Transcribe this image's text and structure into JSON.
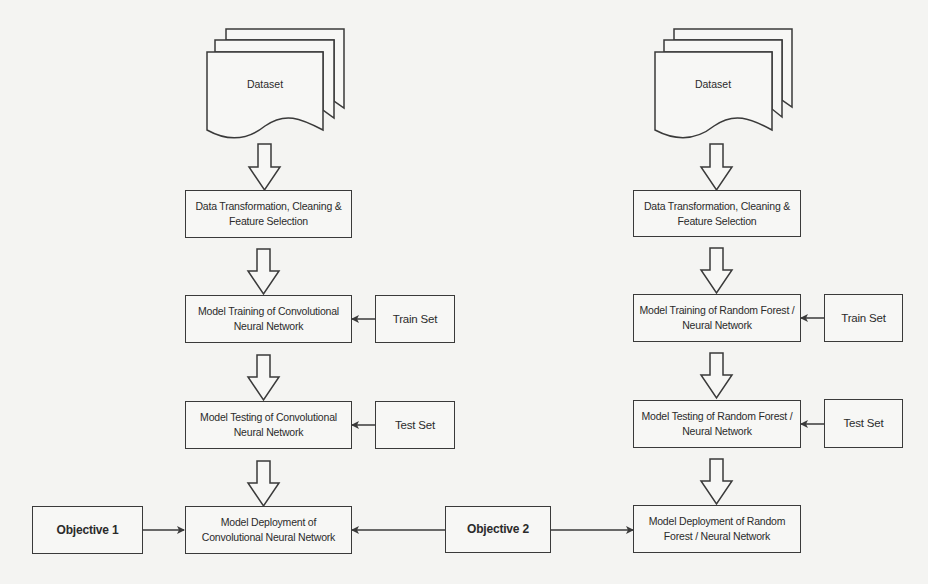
{
  "figure": {
    "type": "flowchart",
    "background_color": "#f4f4f2",
    "stroke_color": "#3a3a3a"
  },
  "left_pipeline": {
    "dataset": "Dataset",
    "preprocess": "Data Transformation, Cleaning & Feature Selection",
    "training": "Model Training of Convolutional Neural Network",
    "train_set": "Train Set",
    "testing": "Model Testing of Convolutional Neural Network",
    "test_set": "Test Set",
    "deployment": "Model Deployment of Convolutional Neural Network",
    "objective": "Objective 1"
  },
  "right_pipeline": {
    "dataset": "Dataset",
    "preprocess": "Data Transformation, Cleaning & Feature Selection",
    "training": "Model Training of Random Forest / Neural Network",
    "train_set": "Train Set",
    "testing": "Model Testing of Random Forest / Neural Network",
    "test_set": "Test Set",
    "deployment": "Model Deployment of Random Forest / Neural Network",
    "objective": "Objective 2"
  }
}
